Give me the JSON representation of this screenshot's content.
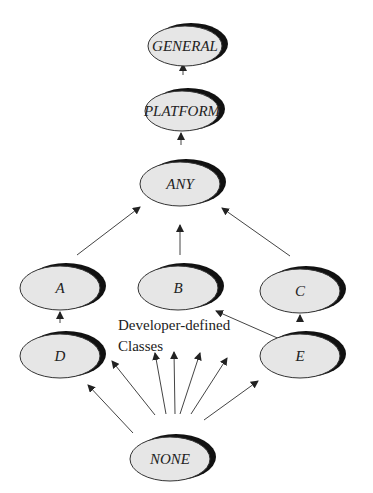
{
  "diagram": {
    "nodes": [
      {
        "id": "general",
        "label": "GENERAL"
      },
      {
        "id": "platform",
        "label": "PLATFORM"
      },
      {
        "id": "any",
        "label": "ANY"
      },
      {
        "id": "a",
        "label": "A"
      },
      {
        "id": "b",
        "label": "B"
      },
      {
        "id": "c",
        "label": "C"
      },
      {
        "id": "d",
        "label": "D"
      },
      {
        "id": "e",
        "label": "E"
      },
      {
        "id": "none",
        "label": "NONE"
      }
    ],
    "edges": [
      {
        "from": "platform",
        "to": "general"
      },
      {
        "from": "any",
        "to": "platform"
      },
      {
        "from": "a",
        "to": "any"
      },
      {
        "from": "b",
        "to": "any"
      },
      {
        "from": "c",
        "to": "any"
      },
      {
        "from": "d",
        "to": "a"
      },
      {
        "from": "e",
        "to": "c"
      },
      {
        "from": "e",
        "to": "b"
      },
      {
        "from": "none",
        "to": "d"
      },
      {
        "from": "none",
        "to": "developer-defined-1"
      },
      {
        "from": "none",
        "to": "developer-defined-2"
      },
      {
        "from": "none",
        "to": "developer-defined-3"
      },
      {
        "from": "none",
        "to": "developer-defined-4"
      },
      {
        "from": "none",
        "to": "developer-defined-5"
      },
      {
        "from": "none",
        "to": "e"
      }
    ],
    "annotation": {
      "line1": "Developer-defined",
      "line2": "Classes"
    }
  }
}
